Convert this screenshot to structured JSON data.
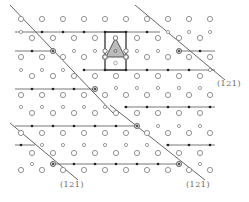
{
  "diagram": {
    "type": "crystal-lattice-projection",
    "colors": {
      "background": "#ffffff",
      "line": "#555555",
      "open_atom": "#777777",
      "solid_atom": "#222222",
      "triangle_fill": "#bbbbbb",
      "label": "#666666"
    },
    "labels": [
      {
        "id": "plane-label-right",
        "text": "(121)",
        "x": 217,
        "y": 79
      },
      {
        "id": "plane-label-bottom-left",
        "text": "(121)",
        "x": 60,
        "y": 180
      },
      {
        "id": "plane-label-bottom-right",
        "text": "(121)",
        "x": 186,
        "y": 180
      }
    ],
    "large_circle_rows": [
      {
        "y": 19,
        "xs": [
          21,
          42,
          63,
          84,
          105,
          126,
          147,
          168,
          189,
          210
        ]
      },
      {
        "y": 38,
        "xs": [
          32,
          53,
          74,
          95,
          137,
          158,
          179,
          200
        ]
      },
      {
        "y": 57,
        "xs": [
          21,
          42,
          63,
          84,
          105,
          126,
          147,
          168,
          189,
          210
        ]
      },
      {
        "y": 76,
        "xs": [
          32,
          53,
          74,
          95,
          116,
          137,
          158,
          179,
          200
        ]
      },
      {
        "y": 95,
        "xs": [
          21,
          42,
          63,
          84,
          105,
          126,
          147,
          168,
          189,
          210
        ]
      },
      {
        "y": 113,
        "xs": [
          32,
          53,
          74,
          95,
          116,
          137,
          158,
          179,
          200
        ]
      },
      {
        "y": 133,
        "xs": [
          21,
          42,
          63,
          84,
          105,
          126,
          147,
          168,
          189,
          210
        ]
      },
      {
        "y": 153,
        "xs": [
          32,
          53,
          74,
          95,
          116,
          137,
          158,
          179,
          200
        ]
      },
      {
        "y": 170,
        "xs": [
          21,
          42,
          63,
          84,
          105,
          126,
          147,
          168,
          189,
          210
        ]
      }
    ],
    "small_circle_rows": [
      {
        "y": 32,
        "xs": [
          21,
          168,
          189,
          210
        ]
      },
      {
        "y": 51,
        "xs": [
          74,
          95,
          137,
          158
        ]
      },
      {
        "y": 70,
        "xs": [
          21,
          42,
          63,
          210
        ]
      },
      {
        "y": 88,
        "xs": [
          116,
          137,
          158,
          179,
          200
        ]
      },
      {
        "y": 107,
        "xs": [
          21,
          42,
          63,
          84,
          105
        ]
      },
      {
        "y": 126,
        "xs": [
          158,
          179,
          200
        ]
      },
      {
        "y": 145,
        "xs": [
          42,
          63,
          84,
          105,
          126,
          147
        ]
      },
      {
        "y": 164,
        "xs": [
          32,
          200
        ]
      }
    ],
    "horizontal_lines": [
      {
        "y": 32,
        "x1": 15,
        "x2": 160
      },
      {
        "y": 51,
        "x1": 15,
        "x2": 53
      },
      {
        "y": 51,
        "x1": 179,
        "x2": 215
      },
      {
        "y": 70,
        "x1": 84,
        "x2": 215
      },
      {
        "y": 89,
        "x1": 15,
        "x2": 95
      },
      {
        "y": 107,
        "x1": 124,
        "x2": 215
      },
      {
        "y": 126,
        "x1": 15,
        "x2": 137
      },
      {
        "y": 145,
        "x1": 15,
        "x2": 35
      },
      {
        "y": 145,
        "x1": 166,
        "x2": 215
      },
      {
        "y": 164,
        "x1": 53,
        "x2": 179
      }
    ],
    "solid_dots": [
      [
        42,
        32
      ],
      [
        63,
        32
      ],
      [
        84,
        32
      ],
      [
        105,
        32
      ],
      [
        126,
        32
      ],
      [
        147,
        32
      ],
      [
        32,
        51
      ],
      [
        200,
        51
      ],
      [
        84,
        70
      ],
      [
        105,
        70
      ],
      [
        126,
        70
      ],
      [
        147,
        70
      ],
      [
        168,
        70
      ],
      [
        189,
        70
      ],
      [
        32,
        89
      ],
      [
        53,
        89
      ],
      [
        74,
        89
      ],
      [
        126,
        107
      ],
      [
        147,
        107
      ],
      [
        168,
        107
      ],
      [
        189,
        107
      ],
      [
        210,
        107
      ],
      [
        32,
        126
      ],
      [
        53,
        126
      ],
      [
        74,
        126
      ],
      [
        95,
        126
      ],
      [
        116,
        126
      ],
      [
        21,
        145
      ],
      [
        168,
        145
      ],
      [
        189,
        145
      ],
      [
        210,
        145
      ],
      [
        74,
        164
      ],
      [
        95,
        164
      ],
      [
        116,
        164
      ],
      [
        137,
        164
      ],
      [
        158,
        164
      ]
    ],
    "ringed_dots": [
      [
        53,
        51
      ],
      [
        179,
        51
      ],
      [
        95,
        89
      ],
      [
        137,
        126
      ],
      [
        53,
        164
      ],
      [
        179,
        164
      ]
    ],
    "diagonal_lines": [
      {
        "x1": 10,
        "y1": 5,
        "x2": 115,
        "y2": 115
      },
      {
        "x1": 135,
        "y1": 5,
        "x2": 225,
        "y2": 80
      },
      {
        "x1": 10,
        "y1": 123,
        "x2": 78,
        "y2": 180
      },
      {
        "x1": 110,
        "y1": 105,
        "x2": 205,
        "y2": 180
      }
    ],
    "unit_cell": {
      "x": 105,
      "y": 32,
      "width": 21,
      "height": 38
    },
    "triangle": {
      "points": "115.5,38 106,57 125,57",
      "center_small_circle": [
        115.5,
        51
      ],
      "below_circle": [
        115.5,
        63
      ]
    }
  }
}
